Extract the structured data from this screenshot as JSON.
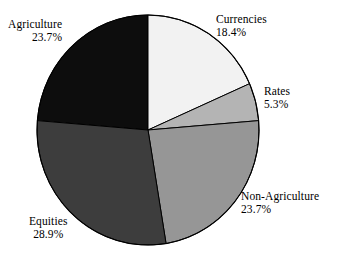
{
  "chart_data": {
    "type": "pie",
    "title": "",
    "subtitle": "",
    "xlabel": "",
    "ylabel": "",
    "grid": false,
    "legend_position": "none",
    "label_format": "name above percent",
    "start_angle_deg": 0,
    "direction": "clockwise",
    "center": {
      "x": 148,
      "y": 130
    },
    "radius": {
      "x": 111,
      "y": 115
    },
    "total_percent": 100.0,
    "categories": [
      "Currencies",
      "Rates",
      "Non-Agriculture",
      "Equities",
      "Agriculture"
    ],
    "values": [
      18.4,
      5.3,
      23.7,
      28.9,
      23.7
    ],
    "slices": [
      {
        "name": "Currencies",
        "percent": 18.4,
        "percent_label": "18.4%",
        "color": "#f2f2f2",
        "start_angle_deg": 0.0,
        "end_angle_deg": 66.24
      },
      {
        "name": "Rates",
        "percent": 5.3,
        "percent_label": "5.3%",
        "color": "#b4b4b4",
        "start_angle_deg": 66.24,
        "end_angle_deg": 85.32
      },
      {
        "name": "Non-Agriculture",
        "percent": 23.7,
        "percent_label": "23.7%",
        "color": "#969696",
        "start_angle_deg": 85.32,
        "end_angle_deg": 170.64
      },
      {
        "name": "Equities",
        "percent": 28.9,
        "percent_label": "28.9%",
        "color": "#3d3d3d",
        "start_angle_deg": 170.64,
        "end_angle_deg": 274.68
      },
      {
        "name": "Agriculture",
        "percent": 23.7,
        "percent_label": "23.7%",
        "color": "#0d0d0d",
        "start_angle_deg": 274.68,
        "end_angle_deg": 360.0
      }
    ],
    "colors": {
      "currencies": "#f2f2f2",
      "rates": "#b4b4b4",
      "non_agriculture": "#969696",
      "equities": "#3d3d3d",
      "agriculture": "#0d0d0d",
      "outline": "#000000",
      "background": "#ffffff",
      "text": "#000000"
    }
  },
  "labels": {
    "agriculture": {
      "name": "Agriculture",
      "percent": "23.7%"
    },
    "currencies": {
      "name": "Currencies",
      "percent": "18.4%"
    },
    "rates": {
      "name": "Rates",
      "percent": "5.3%"
    },
    "non_agriculture": {
      "name": "Non-Agriculture",
      "percent": "23.7%"
    },
    "equities": {
      "name": "Equities",
      "percent": "28.9%"
    }
  }
}
